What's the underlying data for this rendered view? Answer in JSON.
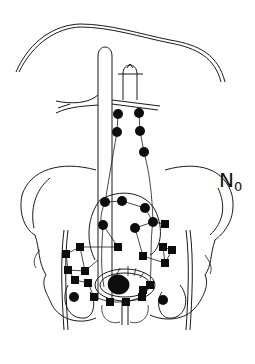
{
  "figure": {
    "type": "anatomical-diagram",
    "label": {
      "main": "N",
      "subscript": "0"
    },
    "colors": {
      "line": "#1a1a1a",
      "node": "#0d0d0d",
      "background": "#ffffff"
    },
    "node_types": [
      "round-node",
      "square-node"
    ],
    "round_nodes": [
      [
        118,
        114
      ],
      [
        139,
        113
      ],
      [
        117,
        132
      ],
      [
        140,
        131
      ],
      [
        144,
        152
      ],
      [
        105,
        202
      ],
      [
        122,
        201
      ],
      [
        145,
        208
      ],
      [
        153,
        222
      ],
      [
        103,
        225
      ],
      [
        135,
        228
      ],
      [
        74,
        297
      ],
      [
        163,
        300
      ],
      [
        104,
        287
      ]
    ],
    "square_nodes": [
      [
        165,
        224
      ],
      [
        118,
        247
      ],
      [
        66,
        254
      ],
      [
        80,
        247
      ],
      [
        68,
        270
      ],
      [
        85,
        271
      ],
      [
        75,
        280
      ],
      [
        88,
        283
      ],
      [
        163,
        247
      ],
      [
        172,
        250
      ],
      [
        143,
        256
      ],
      [
        165,
        263
      ],
      [
        150,
        285
      ],
      [
        143,
        290
      ],
      [
        94,
        297
      ],
      [
        110,
        302
      ],
      [
        126,
        302
      ],
      [
        142,
        297
      ]
    ]
  }
}
